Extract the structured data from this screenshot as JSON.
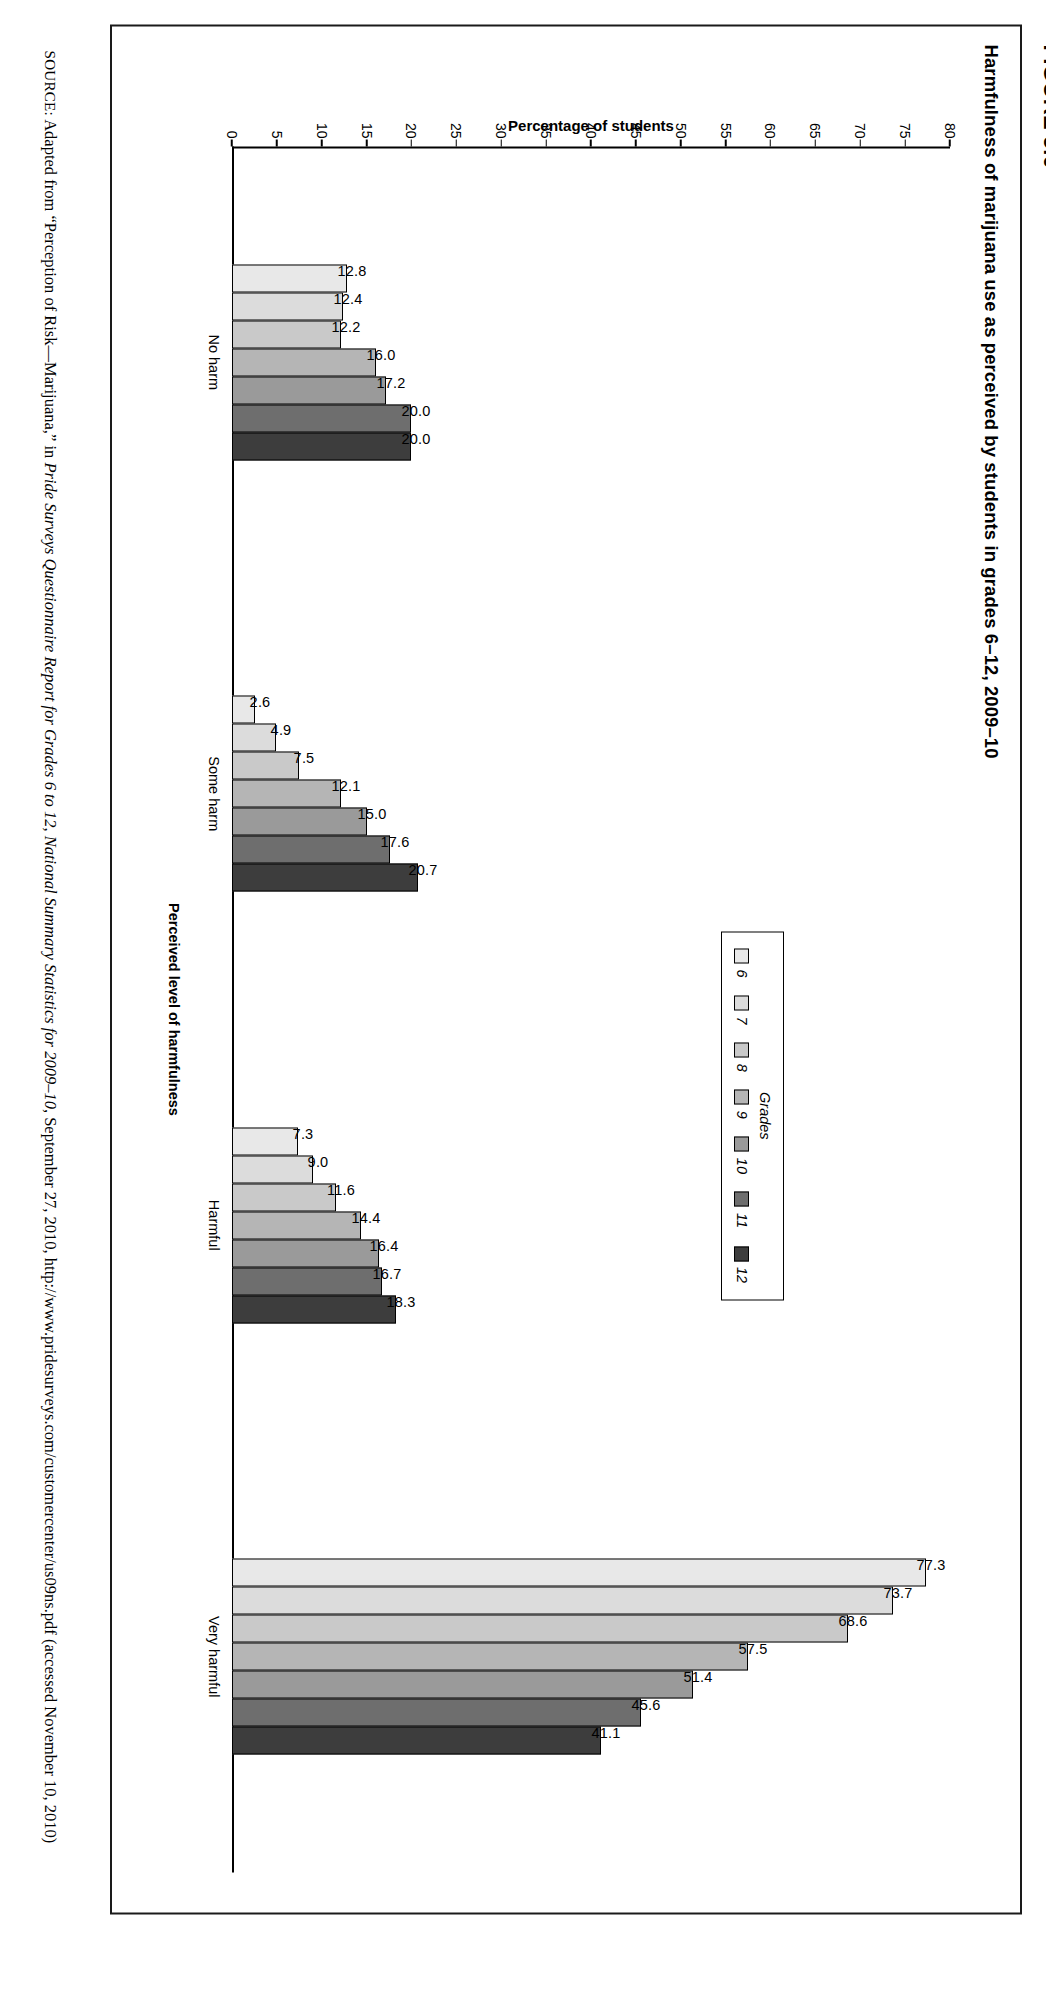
{
  "figure": {
    "number": "FIGURE 5.6",
    "title": "Harmfulness of marijuana use as perceived by students in grades 6–12, 2009–10"
  },
  "source_note": {
    "label": "SOURCE:",
    "text_before_italic": " Adapted from “Perception of Risk—Marijuana,” in ",
    "italic_title": "Pride Surveys Questionnaire Report for Grades 6 to 12, National Summary Statistics for 2009–10",
    "text_after_italic": ", September 27, 2010, http://www.pridesurveys.com/customercenter/us09ns.pdf (accessed November 10, 2010)"
  },
  "legend": {
    "title": "Grades",
    "items": [
      {
        "label": "6",
        "color": "#e8e8e8"
      },
      {
        "label": "7",
        "color": "#dcdcdc"
      },
      {
        "label": "8",
        "color": "#c9c9c9"
      },
      {
        "label": "9",
        "color": "#b5b5b5"
      },
      {
        "label": "10",
        "color": "#9a9a9a"
      },
      {
        "label": "11",
        "color": "#6e6e6e"
      },
      {
        "label": "12",
        "color": "#3d3d3d"
      }
    ]
  },
  "chart_data": {
    "type": "bar",
    "title": "Harmfulness of marijuana use as perceived by students in grades 6–12, 2009–10",
    "xlabel": "Perceived level of harmfulness",
    "ylabel": "Percentage of students",
    "ylim": [
      0,
      80
    ],
    "yticks": [
      0,
      5,
      10,
      15,
      20,
      25,
      30,
      35,
      40,
      45,
      50,
      55,
      60,
      65,
      70,
      75,
      80
    ],
    "grid": false,
    "legend_position": "upper-center-right",
    "categories": [
      "No harm",
      "Some harm",
      "Harmful",
      "Very harmful"
    ],
    "series": [
      {
        "name": "6",
        "color": "#e8e8e8",
        "values": [
          12.8,
          2.6,
          7.3,
          77.3
        ]
      },
      {
        "name": "7",
        "color": "#dcdcdc",
        "values": [
          12.4,
          4.9,
          9.0,
          73.7
        ]
      },
      {
        "name": "8",
        "color": "#c9c9c9",
        "values": [
          12.2,
          7.5,
          11.6,
          68.6
        ]
      },
      {
        "name": "9",
        "color": "#b5b5b5",
        "values": [
          16.0,
          12.1,
          14.4,
          57.5
        ]
      },
      {
        "name": "10",
        "color": "#9a9a9a",
        "values": [
          17.2,
          15.0,
          16.4,
          51.4
        ]
      },
      {
        "name": "11",
        "color": "#6e6e6e",
        "values": [
          20.0,
          17.6,
          16.7,
          45.6
        ]
      },
      {
        "name": "12",
        "color": "#3d3d3d",
        "values": [
          20.0,
          20.7,
          18.3,
          41.1
        ]
      }
    ],
    "value_labels": [
      [
        "12.8",
        "12.4",
        "12.2",
        "16.0",
        "17.2",
        "20.0",
        "20.0"
      ],
      [
        "2.6",
        "4.9",
        "7.5",
        "12.1",
        "15.0",
        "17.6",
        "20.7"
      ],
      [
        "7.3",
        "9.0",
        "11.6",
        "14.4",
        "16.7",
        "16.7",
        "18.3"
      ],
      [
        "77.3",
        "73.7",
        "68.6",
        "57.5",
        "51.4",
        "45.6",
        "41.1"
      ]
    ]
  }
}
